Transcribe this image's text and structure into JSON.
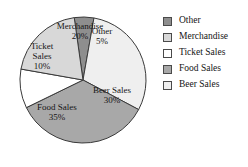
{
  "chart_data": {
    "type": "pie",
    "title": "",
    "categories": [
      "Other",
      "Beer Sales",
      "Food Sales",
      "Ticket Sales",
      "Merchandise"
    ],
    "values": [
      5,
      30,
      35,
      10,
      20
    ],
    "value_unit": "%",
    "legend_position": "right",
    "grid": false,
    "slices": [
      {
        "label": "Other",
        "value": 5,
        "value_label": "5%",
        "color": "#8e8e8e",
        "label_lines": [
          "Other",
          "5%"
        ],
        "label_x": 102,
        "label_y": 37
      },
      {
        "label": "Beer Sales",
        "value": 30,
        "value_label": "30%",
        "color": "#efefef",
        "label_lines": [
          "Beer Sales",
          "30%"
        ],
        "label_x": 112,
        "label_y": 96
      },
      {
        "label": "Food Sales",
        "value": 35,
        "value_label": "35%",
        "color": "#a8a8a8",
        "label_lines": [
          "Food Sales",
          "35%"
        ],
        "label_x": 57,
        "label_y": 113
      },
      {
        "label": "Ticket Sales",
        "value": 10,
        "value_label": "10%",
        "color": "#ffffff",
        "label_lines": [
          "Ticket",
          "Sales",
          "10%"
        ],
        "label_x": 42,
        "label_y": 57
      },
      {
        "label": "Merchandise",
        "value": 20,
        "value_label": "20%",
        "color": "#d8d8d8",
        "label_lines": [
          "Merchandise",
          "20%"
        ],
        "label_x": 80,
        "label_y": 32
      }
    ],
    "geometry": {
      "cx": 83,
      "cy": 80,
      "r": 63,
      "start_angle_deg": -8
    }
  },
  "legend": {
    "items": [
      {
        "label": "Other",
        "color": "#8e8e8e"
      },
      {
        "label": "Merchandise",
        "color": "#d8d8d8"
      },
      {
        "label": "Ticket Sales",
        "color": "#ffffff"
      },
      {
        "label": "Food Sales",
        "color": "#a8a8a8"
      },
      {
        "label": "Beer Sales",
        "color": "#efefef"
      }
    ]
  }
}
